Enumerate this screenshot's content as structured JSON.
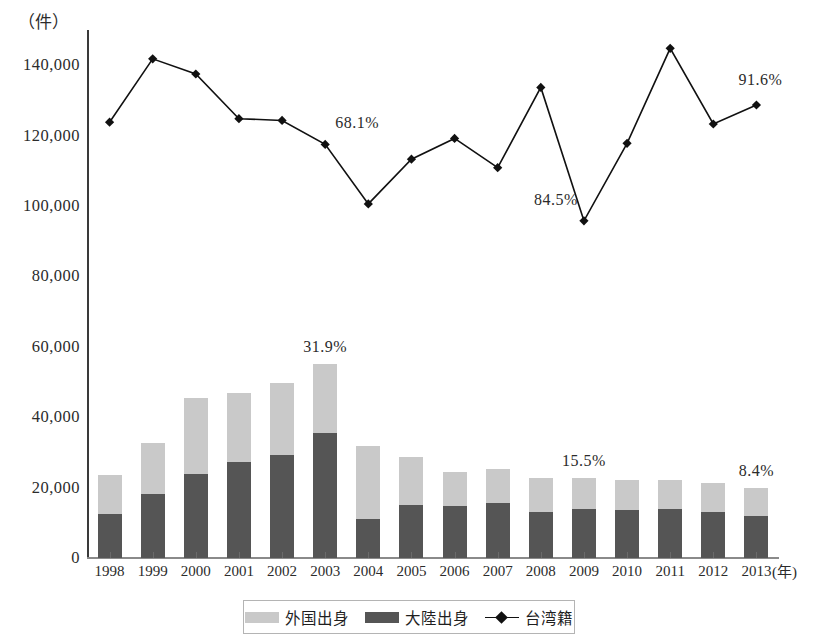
{
  "chart_data": {
    "type": "bar",
    "title": "",
    "subtitle": "",
    "xlabel": "年",
    "ylabel": "件",
    "y_unit_label": "（件）",
    "x_unit_label": "(年)",
    "ylim": [
      0,
      150000
    ],
    "yticks": [
      0,
      20000,
      40000,
      60000,
      80000,
      100000,
      120000,
      140000
    ],
    "ytick_labels": [
      "0",
      "20,000",
      "40,000",
      "60,000",
      "80,000",
      "100,000",
      "120,000",
      "140,000"
    ],
    "grid": false,
    "legend_position": "bottom",
    "stacked": true,
    "categories": [
      "1998",
      "1999",
      "2000",
      "2001",
      "2002",
      "2003",
      "2004",
      "2005",
      "2006",
      "2007",
      "2008",
      "2009",
      "2010",
      "2011",
      "2012",
      "2013"
    ],
    "series": [
      {
        "name": "大陸出身",
        "type": "bar",
        "stack": "bars",
        "color": "#555555",
        "values": [
          12600,
          18200,
          24000,
          27200,
          29400,
          35600,
          11200,
          15000,
          14800,
          15600,
          13200,
          13800,
          13700,
          14000,
          13100,
          11800
        ]
      },
      {
        "name": "外国出身",
        "type": "bar",
        "stack": "bars",
        "color": "#c9c9c9",
        "values": [
          10900,
          14400,
          21600,
          19600,
          20200,
          19400,
          20600,
          13800,
          9600,
          9800,
          9400,
          8800,
          8600,
          8100,
          8200,
          8200
        ]
      },
      {
        "name": "台湾籍",
        "type": "line",
        "color": "#111111",
        "marker": "diamond",
        "values": [
          123800,
          141800,
          137500,
          124800,
          124300,
          117500,
          100600,
          113300,
          119200,
          110900,
          133700,
          95800,
          117800,
          144800,
          123300,
          128700
        ]
      }
    ],
    "annotations": [
      {
        "text": "68.1%",
        "series": "台湾籍",
        "category": "2003",
        "x": 2003,
        "y": 117500
      },
      {
        "text": "84.5%",
        "series": "台湾籍",
        "category": "2009",
        "x": 2009,
        "y": 95800
      },
      {
        "text": "91.6%",
        "series": "台湾籍",
        "category": "2013",
        "x": 2013,
        "y": 128700
      },
      {
        "text": "31.9%",
        "series": "bars",
        "category": "2003",
        "x": 2003,
        "y": 55000
      },
      {
        "text": "15.5%",
        "series": "bars",
        "category": "2009",
        "x": 2009,
        "y": 22600
      },
      {
        "text": "8.4%",
        "series": "bars",
        "category": "2013",
        "x": 2013,
        "y": 20000
      }
    ]
  },
  "legend": {
    "items": [
      {
        "label": "外国出身",
        "swatch": "#c9c9c9",
        "kind": "box"
      },
      {
        "label": "大陸出身",
        "swatch": "#555555",
        "kind": "box"
      },
      {
        "label": "台湾籍",
        "swatch": "#111111",
        "kind": "line-diamond"
      }
    ]
  }
}
